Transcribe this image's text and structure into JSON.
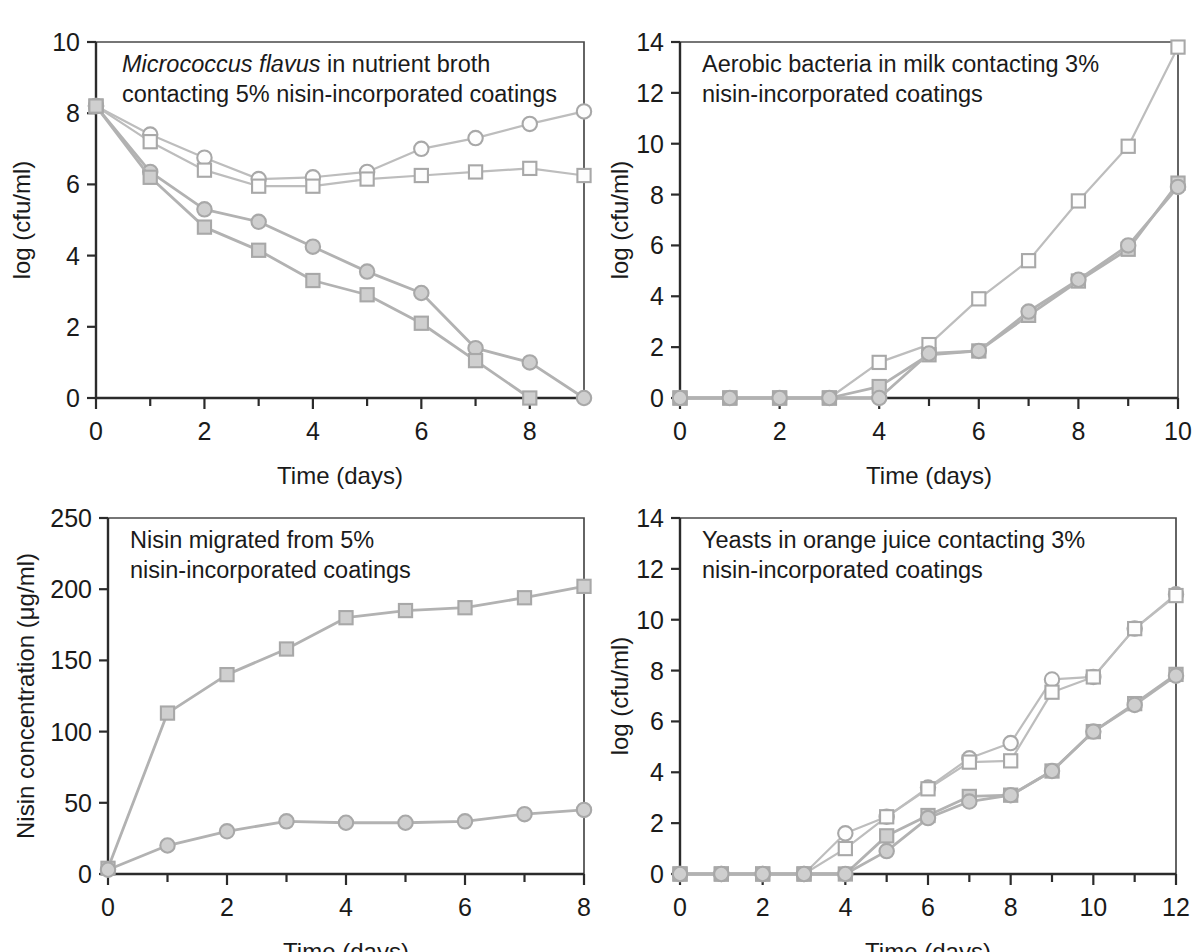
{
  "figure": {
    "background": "#ffffff",
    "line_color": "#b2b2b2",
    "marker_fill_open": "#fdfdfd",
    "marker_fill_closed": "#cfcfcf",
    "marker_stroke": "#a8a8a8",
    "axis_color": "#2b2b2b"
  },
  "panels": [
    {
      "id": "panel-top-left",
      "caption_italic": "Micrococcus flavus",
      "caption_rest_line1": " in nutrient broth",
      "caption_line2": "contacting 5% nisin-incorporated coatings",
      "xlabel": "Time (days)",
      "ylabel": "log (cfu/ml)"
    },
    {
      "id": "panel-top-right",
      "caption_line1": "Aerobic bacteria in milk contacting 3%",
      "caption_line2": "nisin-incorporated coatings",
      "xlabel": "Time (days)",
      "ylabel": "log (cfu/ml)"
    },
    {
      "id": "panel-bottom-left",
      "caption_line1": "Nisin migrated from 5%",
      "caption_line2": "nisin-incorporated coatings",
      "xlabel": "Time (days)",
      "ylabel": "Nisin concentration (μg/ml)"
    },
    {
      "id": "panel-bottom-right",
      "caption_line1": "Yeasts in orange juice contacting 3%",
      "caption_line2": "nisin-incorporated coatings",
      "xlabel": "Time (days)",
      "ylabel": "log (cfu/ml)"
    }
  ],
  "chart_data": [
    {
      "type": "line",
      "title": "Micrococcus flavus in nutrient broth contacting 5% nisin-incorporated coatings",
      "xlabel": "Time (days)",
      "ylabel": "log (cfu/ml)",
      "xlim": [
        0,
        9
      ],
      "ylim": [
        0,
        10
      ],
      "xticks": [
        0,
        1,
        2,
        3,
        4,
        5,
        6,
        7,
        8,
        9
      ],
      "xticklabels": [
        "0",
        "",
        "2",
        "",
        "4",
        "",
        "6",
        "",
        "8",
        ""
      ],
      "yticks": [
        0,
        2,
        4,
        6,
        8,
        10
      ],
      "yticklabels": [
        "0",
        "2",
        "4",
        "6",
        "8",
        "10"
      ],
      "grid": false,
      "legend": "none",
      "series": [
        {
          "name": "open-circle",
          "marker": "open-circle",
          "x": [
            0,
            1,
            2,
            3,
            4,
            5,
            6,
            7,
            8,
            9
          ],
          "values": [
            8.2,
            7.4,
            6.75,
            6.15,
            6.2,
            6.35,
            7.0,
            7.3,
            7.7,
            8.05
          ]
        },
        {
          "name": "open-square",
          "marker": "open-square",
          "x": [
            0,
            1,
            2,
            3,
            4,
            5,
            6,
            7,
            8,
            9
          ],
          "values": [
            8.2,
            7.2,
            6.4,
            5.95,
            5.95,
            6.15,
            6.25,
            6.35,
            6.45,
            6.25
          ]
        },
        {
          "name": "filled-circle",
          "marker": "filled-circle",
          "x": [
            0,
            1,
            2,
            3,
            4,
            5,
            6,
            7,
            8,
            9
          ],
          "values": [
            8.2,
            6.35,
            5.3,
            4.95,
            4.25,
            3.55,
            2.95,
            1.4,
            1.0,
            0.0
          ]
        },
        {
          "name": "filled-square",
          "marker": "filled-square",
          "x": [
            0,
            1,
            2,
            3,
            4,
            5,
            6,
            7,
            8
          ],
          "values": [
            8.2,
            6.2,
            4.8,
            4.15,
            3.3,
            2.9,
            2.1,
            1.05,
            0.0
          ]
        }
      ]
    },
    {
      "type": "line",
      "title": "Aerobic bacteria in milk contacting 3% nisin-incorporated coatings",
      "xlabel": "Time (days)",
      "ylabel": "log (cfu/ml)",
      "xlim": [
        0,
        10
      ],
      "ylim": [
        0,
        14
      ],
      "xticks": [
        0,
        1,
        2,
        3,
        4,
        5,
        6,
        7,
        8,
        9,
        10
      ],
      "xticklabels": [
        "0",
        "",
        "2",
        "",
        "4",
        "",
        "6",
        "",
        "8",
        "",
        "10"
      ],
      "yticks": [
        0,
        2,
        4,
        6,
        8,
        10,
        12,
        14
      ],
      "yticklabels": [
        "0",
        "2",
        "4",
        "6",
        "8",
        "10",
        "12",
        "14"
      ],
      "grid": false,
      "legend": "none",
      "series": [
        {
          "name": "open-square",
          "marker": "open-square",
          "x": [
            0,
            1,
            2,
            3,
            4,
            5,
            6,
            7,
            8,
            9,
            10
          ],
          "values": [
            0.0,
            0.0,
            0.0,
            0.0,
            1.4,
            2.1,
            3.9,
            5.4,
            7.75,
            9.9,
            13.8
          ]
        },
        {
          "name": "filled-square",
          "marker": "filled-square",
          "x": [
            0,
            1,
            2,
            3,
            4,
            5,
            6,
            7,
            8,
            9,
            10
          ],
          "values": [
            0.0,
            0.0,
            0.0,
            0.0,
            0.45,
            1.7,
            1.85,
            3.25,
            4.6,
            5.85,
            8.45
          ]
        },
        {
          "name": "filled-circle",
          "marker": "filled-circle",
          "x": [
            0,
            1,
            2,
            3,
            4,
            5,
            6,
            7,
            8,
            9,
            10
          ],
          "values": [
            0.0,
            0.0,
            0.0,
            0.0,
            0.0,
            1.75,
            1.85,
            3.4,
            4.65,
            6.0,
            8.3
          ]
        }
      ]
    },
    {
      "type": "line",
      "title": "Nisin migrated from 5% nisin-incorporated coatings",
      "xlabel": "Time (days)",
      "ylabel": "Nisin concentration (μg/ml)",
      "xlim": [
        0,
        8
      ],
      "ylim": [
        0,
        250
      ],
      "xticks": [
        0,
        1,
        2,
        3,
        4,
        5,
        6,
        7,
        8
      ],
      "xticklabels": [
        "0",
        "",
        "2",
        "",
        "4",
        "",
        "6",
        "",
        "8"
      ],
      "yticks": [
        0,
        50,
        100,
        150,
        200,
        250
      ],
      "yticklabels": [
        "0",
        "50",
        "100",
        "150",
        "200",
        "250"
      ],
      "grid": false,
      "legend": "none",
      "series": [
        {
          "name": "filled-square",
          "marker": "filled-square",
          "x": [
            0,
            1,
            2,
            3,
            4,
            5,
            6,
            7,
            8
          ],
          "values": [
            4,
            113,
            140,
            158,
            180,
            185,
            187,
            194,
            202
          ]
        },
        {
          "name": "filled-circle",
          "marker": "filled-circle",
          "x": [
            0,
            1,
            2,
            3,
            4,
            5,
            6,
            7,
            8
          ],
          "values": [
            3,
            20,
            30,
            37,
            36,
            36,
            37,
            42,
            45
          ]
        }
      ]
    },
    {
      "type": "line",
      "title": "Yeasts in orange juice contacting 3% nisin-incorporated coatings",
      "xlabel": "Time (days)",
      "ylabel": "log (cfu/ml)",
      "xlim": [
        0,
        12
      ],
      "ylim": [
        0,
        14
      ],
      "xticks": [
        0,
        1,
        2,
        3,
        4,
        5,
        6,
        7,
        8,
        9,
        10,
        11,
        12
      ],
      "xticklabels": [
        "0",
        "",
        "2",
        "",
        "4",
        "",
        "6",
        "",
        "8",
        "",
        "10",
        "",
        "12"
      ],
      "yticks": [
        0,
        2,
        4,
        6,
        8,
        10,
        12,
        14
      ],
      "yticklabels": [
        "0",
        "2",
        "4",
        "6",
        "8",
        "10",
        "12",
        "14"
      ],
      "grid": false,
      "legend": "none",
      "series": [
        {
          "name": "open-circle",
          "marker": "open-circle",
          "x": [
            0,
            1,
            2,
            3,
            4,
            5,
            6,
            7,
            8,
            9,
            10,
            11,
            12
          ],
          "values": [
            0.0,
            0.0,
            0.0,
            0.0,
            1.6,
            2.25,
            3.4,
            4.55,
            5.15,
            7.65,
            7.75,
            9.65,
            11.0
          ]
        },
        {
          "name": "open-square",
          "marker": "open-square",
          "x": [
            0,
            1,
            2,
            3,
            4,
            5,
            6,
            7,
            8,
            9,
            10,
            11,
            12
          ],
          "values": [
            0.0,
            0.0,
            0.0,
            0.0,
            1.0,
            2.25,
            3.35,
            4.4,
            4.45,
            7.15,
            7.75,
            9.65,
            10.95
          ]
        },
        {
          "name": "filled-square",
          "marker": "filled-square",
          "x": [
            0,
            1,
            2,
            3,
            4,
            5,
            6,
            7,
            8,
            9,
            10,
            11,
            12
          ],
          "values": [
            0.0,
            0.0,
            0.0,
            0.0,
            0.0,
            1.5,
            2.3,
            3.05,
            3.1,
            4.05,
            5.6,
            6.7,
            7.85
          ]
        },
        {
          "name": "filled-circle",
          "marker": "filled-circle",
          "x": [
            0,
            1,
            2,
            3,
            4,
            5,
            6,
            7,
            8,
            9,
            10,
            11,
            12
          ],
          "values": [
            0.0,
            0.0,
            0.0,
            0.0,
            0.0,
            0.9,
            2.2,
            2.85,
            3.1,
            4.05,
            5.6,
            6.65,
            7.8
          ]
        }
      ]
    }
  ]
}
